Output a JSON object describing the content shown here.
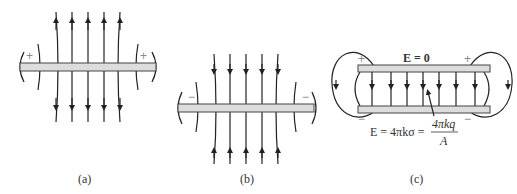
{
  "figure": {
    "panels": [
      {
        "id": "a",
        "caption": "(a)",
        "plate_charge": "+",
        "field_direction": "outward"
      },
      {
        "id": "b",
        "caption": "(b)",
        "plate_charge": "−",
        "field_direction": "inward"
      },
      {
        "id": "c",
        "caption": "(c)",
        "top_sign": "+",
        "bottom_sign": "−"
      }
    ],
    "panel_c": {
      "outside_field": "E = 0",
      "inside_field_lhs": "E = 4πkσ =",
      "fraction_num": "4πkq",
      "fraction_den": "A"
    }
  }
}
